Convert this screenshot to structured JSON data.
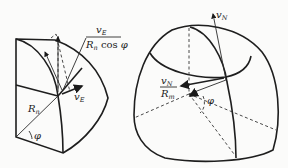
{
  "left_figure": {
    "title": "east-velocity-octant",
    "labels": {
      "ve_fraction_num": "v",
      "ve_fraction_num_sub": "E",
      "ve_fraction_den_R": "R",
      "ve_fraction_den_R_sub": "n",
      "ve_fraction_den_rest": " cos ",
      "ve_fraction_den_phi": "φ",
      "ve_label": "v",
      "ve_label_sub": "E",
      "rn_label": "R",
      "rn_label_sub": "n",
      "phi_label": "φ"
    }
  },
  "right_figure": {
    "title": "north-velocity-ellipsoid",
    "labels": {
      "vn_top": "v",
      "vn_top_sub": "N",
      "vn_fraction_num": "v",
      "vn_fraction_num_sub": "N",
      "vn_fraction_den": "R",
      "vn_fraction_den_sub": "m",
      "phi_label": "φ"
    }
  }
}
